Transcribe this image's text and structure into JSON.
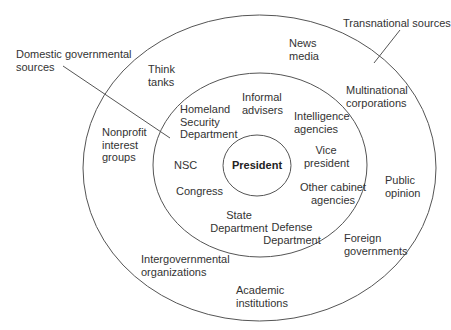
{
  "diagram": {
    "type": "concentric-ellipses",
    "center": {
      "label": "President"
    },
    "callouts": {
      "domestic": "Domestic governmental\nsources",
      "transnational": "Transnational sources"
    },
    "inner_ring": {
      "items": [
        {
          "id": "homeland",
          "label": "Homeland\nSecurity\nDepartment"
        },
        {
          "id": "informal",
          "label": "Informal\nadvisers"
        },
        {
          "id": "intelligence",
          "label": "Intelligence\nagencies"
        },
        {
          "id": "vp",
          "label": "Vice\npresident"
        },
        {
          "id": "other-cabinet",
          "label": "Other cabinet\nagencies"
        },
        {
          "id": "defense",
          "label": "Defense\nDepartment"
        },
        {
          "id": "state",
          "label": "State\nDepartment"
        },
        {
          "id": "congress",
          "label": "Congress"
        },
        {
          "id": "nsc",
          "label": "NSC"
        }
      ]
    },
    "outer_ring": {
      "items": [
        {
          "id": "think-tanks",
          "label": "Think\ntanks"
        },
        {
          "id": "news-media",
          "label": "News\nmedia"
        },
        {
          "id": "multinational",
          "label": "Multinational\ncorporations"
        },
        {
          "id": "public-opinion",
          "label": "Public\nopinion"
        },
        {
          "id": "foreign-gov",
          "label": "Foreign\ngovernments"
        },
        {
          "id": "academic",
          "label": "Academic\ninstitutions"
        },
        {
          "id": "igo",
          "label": "Intergovernmental\norganizations"
        },
        {
          "id": "nonprofit",
          "label": "Nonprofit\ninterest\ngroups"
        }
      ]
    },
    "colors": {
      "stroke": "#555555",
      "text": "#333333",
      "background": "#ffffff"
    }
  }
}
